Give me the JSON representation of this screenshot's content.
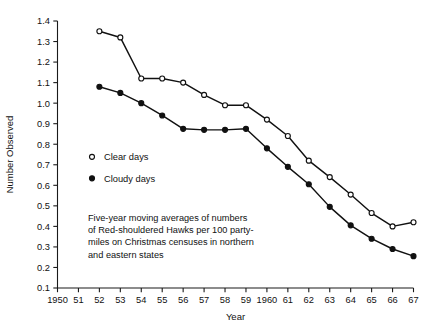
{
  "chart_data": {
    "type": "line",
    "title": "",
    "xlabel": "Year",
    "ylabel": "Number Observed",
    "xlim": [
      1950,
      1967
    ],
    "ylim": [
      0.1,
      1.4
    ],
    "grid": false,
    "legend_position": "inside-left",
    "x": [
      1952,
      1953,
      1954,
      1955,
      1956,
      1957,
      1958,
      1959,
      1960,
      1961,
      1962,
      1963,
      1964,
      1965,
      1966,
      1967
    ],
    "xtick_labels": [
      "1950",
      "51",
      "52",
      "53",
      "54",
      "55",
      "56",
      "57",
      "58",
      "59",
      "1960",
      "61",
      "62",
      "63",
      "64",
      "65",
      "66",
      "67"
    ],
    "xtick_values": [
      1950,
      1951,
      1952,
      1953,
      1954,
      1955,
      1956,
      1957,
      1958,
      1959,
      1960,
      1961,
      1962,
      1963,
      1964,
      1965,
      1966,
      1967
    ],
    "ytick_labels": [
      "0.1",
      "0.2",
      "0.3",
      "0.4",
      "0.5",
      "0.6",
      "0.7",
      "0.8",
      "0.9",
      "1.0",
      "1.1",
      "1.2",
      "1.3",
      "1.4"
    ],
    "ytick_values": [
      0.1,
      0.2,
      0.3,
      0.4,
      0.5,
      0.6,
      0.7,
      0.8,
      0.9,
      1.0,
      1.1,
      1.2,
      1.3,
      1.4
    ],
    "series": [
      {
        "name": "Clear days",
        "marker": "open-circle",
        "values": [
          1.35,
          1.32,
          1.12,
          1.12,
          1.1,
          1.04,
          0.99,
          0.99,
          0.92,
          0.84,
          0.72,
          0.64,
          0.555,
          0.465,
          0.4,
          0.42
        ]
      },
      {
        "name": "Cloudy days",
        "marker": "filled-circle",
        "values": [
          1.08,
          1.05,
          1.0,
          0.94,
          0.875,
          0.87,
          0.87,
          0.875,
          0.78,
          0.69,
          0.605,
          0.495,
          0.405,
          0.34,
          0.29,
          0.255
        ]
      }
    ],
    "annotation": "Five-year moving averages of numbers of Red-shouldered Hawks per 100 party-miles on Christmas censuses in northern and eastern states"
  },
  "legend": {
    "items": [
      {
        "label": "Clear days",
        "marker": "open-circle"
      },
      {
        "label": "Cloudy days",
        "marker": "filled-circle"
      }
    ]
  },
  "caption": {
    "lines": [
      "Five-year moving averages of numbers",
      "of Red-shouldered Hawks per 100 party-",
      "miles on Christmas censuses in northern",
      "and eastern states"
    ]
  },
  "axes": {
    "x_title": "Year",
    "y_title": "Number Observed"
  }
}
